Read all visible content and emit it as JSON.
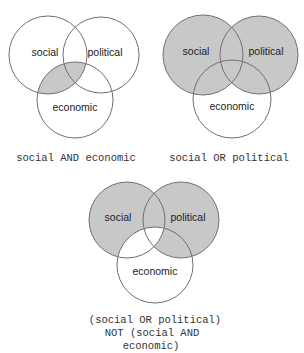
{
  "colors": {
    "fill": "#c8c8c8",
    "stroke": "#707070",
    "background": "#ffffff"
  },
  "labels": {
    "social": "social",
    "political": "political",
    "economic": "economic"
  },
  "diagrams": [
    {
      "caption": [
        "social AND economic"
      ]
    },
    {
      "caption": [
        "social OR political"
      ]
    },
    {
      "caption": [
        "(social OR political)",
        "NOT (social AND",
        "economic)"
      ]
    }
  ]
}
